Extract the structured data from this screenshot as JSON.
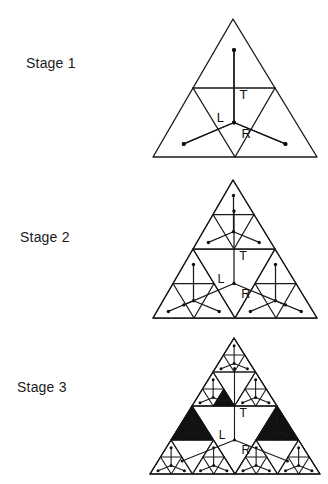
{
  "figure": {
    "background_color": "#ffffff",
    "line_color": "#1a1a1a",
    "fill_color": "#111111",
    "width": 328,
    "height": 484
  },
  "stages": [
    {
      "id": "stage-1",
      "label": "Stage 1",
      "label_x": 26,
      "label_y": 62,
      "depth": 1,
      "apex_x": 233,
      "base_y": 157,
      "half_width": 80,
      "node_labels": {
        "T": "T",
        "L": "L",
        "R": "R"
      },
      "show_node_labels": true,
      "filled_triangles": 0
    },
    {
      "id": "stage-2",
      "label": "Stage 2",
      "label_x": 20,
      "label_y": 236,
      "depth": 2,
      "apex_x": 233,
      "base_y": 319,
      "half_width": 80,
      "node_labels": {
        "T": "T",
        "L": "L",
        "R": "R"
      },
      "show_node_labels": true,
      "filled_triangles": 0
    },
    {
      "id": "stage-3",
      "label": "Stage 3",
      "label_x": 17,
      "label_y": 386,
      "depth": 3,
      "apex_x": 233,
      "base_y": 472,
      "half_width": 83,
      "node_labels": {
        "T": "T",
        "L": "L",
        "R": "R"
      },
      "show_node_labels": true,
      "filled_triangles": 3,
      "filled_triangle_notes": "three solid black upward-pointing sub-triangles"
    }
  ],
  "motif": {
    "description": "horizontal chord across mid-height plus a three-armed Y stem with dot terminals",
    "stem_label_top": "T",
    "stem_label_left": "L",
    "stem_label_right": "R"
  }
}
